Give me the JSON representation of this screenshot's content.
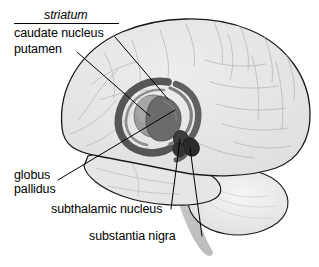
{
  "diagram": {
    "view": "lateral (side) view of human brain, facing left",
    "background_color": "#ffffff",
    "outline_color": "#1a1a1a",
    "brain_fill": "#e8e8e8",
    "sulci_color": "#b9b9b9"
  },
  "labels": {
    "striatum": "striatum",
    "caudate_nucleus": "caudate nucleus",
    "putamen": "putamen",
    "globus": "globus",
    "pallidus": "pallidus",
    "subthalamic_nucleus": "subthalamic nucleus",
    "substantia_nigra": "substantia nigra"
  },
  "structures": [
    {
      "name": "caudate nucleus",
      "color": "#5c5c5c",
      "shape": "C-shaped ring with long tail curving around the putamen"
    },
    {
      "name": "putamen",
      "color": "#9c9c9c",
      "shape": "rounded oval lens at the centre of the ring"
    },
    {
      "name": "globus pallidus",
      "color": "#6b6b6b",
      "shape": "darker wedge medial to and overlapping the putamen"
    },
    {
      "name": "subthalamic nucleus",
      "color": "#3a3a3a",
      "shape": "small dark oval blob below and right of the putamen"
    },
    {
      "name": "substantia nigra",
      "color": "#2e2e2e",
      "shape": "small dark elongated blob beneath the subthalamic nucleus"
    },
    {
      "name": "cerebellum",
      "color": "#e2e2e2",
      "shape": "rounded lobed mass at lower right"
    },
    {
      "name": "brainstem",
      "color": "#c9c9c9",
      "shape": "tapering band descending from the centre to the lower edge"
    }
  ],
  "leader_lines": [
    {
      "label": "caudate nucleus",
      "from": [
        115,
        37
      ],
      "to": [
        168,
        99
      ]
    },
    {
      "label": "putamen",
      "from": [
        77,
        52
      ],
      "to": [
        150,
        116
      ]
    },
    {
      "label": "globus pallidus",
      "from": [
        58,
        180
      ],
      "to": [
        175,
        110
      ]
    },
    {
      "label": "subthalamic nucleus",
      "from": [
        171,
        209
      ],
      "to": [
        180,
        139
      ]
    },
    {
      "label": "substantia nigra",
      "from": [
        202,
        236
      ],
      "to": [
        190,
        148
      ]
    }
  ]
}
